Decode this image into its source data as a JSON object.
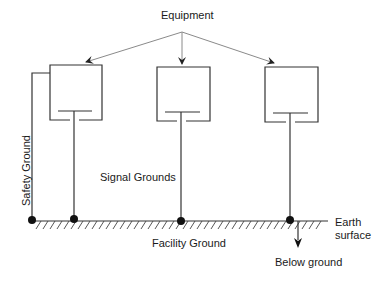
{
  "diagram": {
    "title_label": "Equipment",
    "labels": {
      "equipment": "Equipment",
      "safety_ground": "Safety Ground",
      "signal_grounds": "Signal Grounds",
      "facility_ground": "Facility Ground",
      "earth_surface_line1": "Earth",
      "earth_surface_line2": "surface",
      "below_ground": "Below ground"
    },
    "equipment_boxes": [
      {
        "id": "equipment-1"
      },
      {
        "id": "equipment-2"
      },
      {
        "id": "equipment-3"
      }
    ],
    "ground_connections": [
      {
        "id": "safety-ground-node"
      },
      {
        "id": "signal-ground-node-1"
      },
      {
        "id": "signal-ground-node-2"
      },
      {
        "id": "signal-ground-node-3"
      }
    ],
    "colors": {
      "line": "#333333",
      "arrow_line": "#8a8a8a",
      "text": "#1a1a1a"
    }
  }
}
